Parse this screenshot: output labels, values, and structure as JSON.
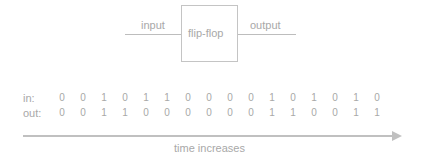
{
  "diagram": {
    "input_label": "input",
    "block_label": "flip-flop",
    "output_label": "output"
  },
  "rows": [
    {
      "label": "in:",
      "values": [
        "0",
        "0",
        "1",
        "0",
        "1",
        "1",
        "0",
        "0",
        "0",
        "0",
        "1",
        "0",
        "1",
        "0",
        "1",
        "0"
      ]
    },
    {
      "label": "out:",
      "values": [
        "0",
        "0",
        "1",
        "1",
        "0",
        "0",
        "0",
        "0",
        "0",
        "0",
        "1",
        "1",
        "0",
        "0",
        "1",
        "1"
      ]
    }
  ],
  "axis": {
    "label": "time increases"
  },
  "colors": {
    "line": "#bdbdbd",
    "text": "#a8a8a8"
  }
}
